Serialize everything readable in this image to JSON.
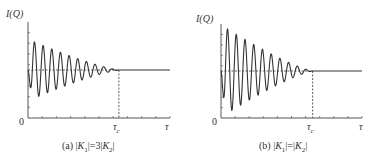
{
  "chart_data": [
    {
      "type": "line",
      "panel": "a",
      "caption": "(a) |K₁|=3|K₂|",
      "ylabel": "I(Q)",
      "xlabel": "τ",
      "origin_label": "0",
      "marker_label": "τc",
      "title": "",
      "grid": false,
      "y_ticks_count": 8,
      "x_ticks_count": 10,
      "series": [
        {
          "name": "I(Q)",
          "description": "damped oscillation around mean level, converging to constant at tau_c",
          "mean_level": 0.5,
          "initial_amplitude": 0.32,
          "oscillations_before_tau_c": 10,
          "first_swing": "down",
          "value_after_tau_c": 0.5
        }
      ],
      "reference_lines": [
        {
          "type": "horizontal_dashed",
          "y": 0.5,
          "from": 0,
          "to": "tau_c"
        },
        {
          "type": "vertical_dashed",
          "x": "tau_c",
          "from_y": 0,
          "to_y": 0.5
        }
      ],
      "xlim": [
        0,
        1
      ],
      "tau_c": 0.64,
      "ylim": [
        0,
        1
      ]
    },
    {
      "type": "line",
      "panel": "b",
      "caption": "(b) |K₁|=|K₂|",
      "ylabel": "I(Q)",
      "xlabel": "τ",
      "origin_label": "0",
      "marker_label": "τc",
      "title": "",
      "grid": false,
      "y_ticks_count": 8,
      "x_ticks_count": 10,
      "series": [
        {
          "name": "I(Q)",
          "description": "damped oscillation around mean level with full-depth initial swings, converging at tau_c",
          "mean_level": 0.5,
          "initial_amplitude": 0.5,
          "oscillations_before_tau_c": 10,
          "first_swing": "down",
          "value_after_tau_c": 0.5
        }
      ],
      "reference_lines": [
        {
          "type": "horizontal_dashed",
          "y": 0.5,
          "from": 0,
          "to": "tau_c"
        },
        {
          "type": "vertical_dashed",
          "x": "tau_c",
          "from_y": 0,
          "to_y": 0.5
        }
      ],
      "xlim": [
        0,
        1
      ],
      "tau_c": 0.65,
      "ylim": [
        0,
        1
      ]
    }
  ],
  "panels": {
    "a": {
      "ylabel_main": "I(Q)",
      "origin": "0",
      "tau_c_main": "τ",
      "tau_c_sub": "c",
      "tau": "τ",
      "caption_prefix": "(a) |",
      "k1": "K",
      "k1_sub": "1",
      "mid": "|=3|",
      "k2": "K",
      "k2_sub": "2",
      "caption_suffix": "|"
    },
    "b": {
      "ylabel_main": "I(Q)",
      "origin": "0",
      "tau_c_main": "τ",
      "tau_c_sub": "c",
      "tau": "τ",
      "caption_prefix": "(b) |",
      "k1": "K",
      "k1_sub": "1",
      "mid": "|=|",
      "k2": "K",
      "k2_sub": "2",
      "caption_suffix": "|"
    }
  },
  "style": {
    "line_color": "#333333",
    "axis_color": "#444444",
    "background": "#ffffff"
  }
}
